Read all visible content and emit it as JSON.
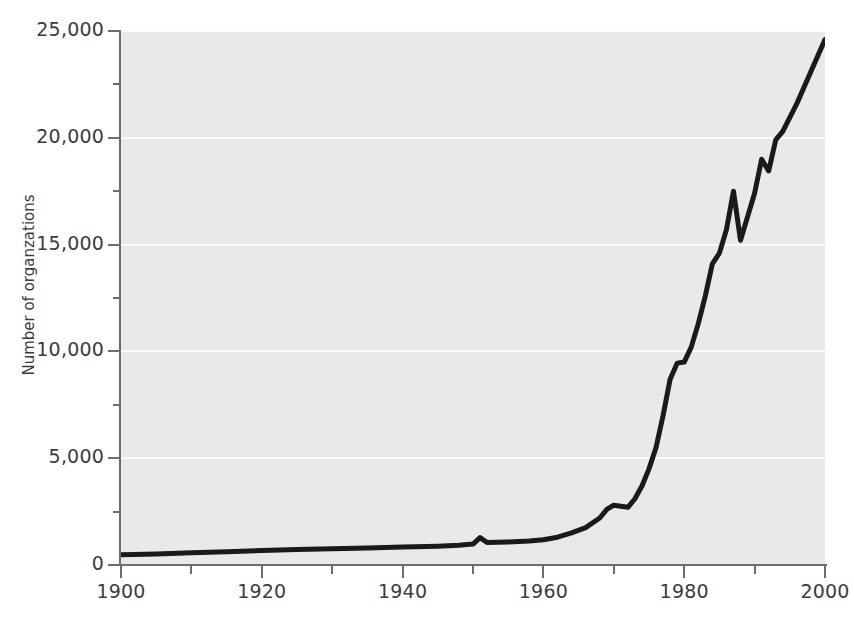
{
  "chart_data": {
    "type": "line",
    "title": "",
    "subtitle": "",
    "xlabel": "",
    "ylabel": "Number of organzations",
    "xlim": [
      1900,
      2000
    ],
    "ylim": [
      0,
      25000
    ],
    "grid": true,
    "legend": null,
    "x_ticks": [
      1900,
      1920,
      1940,
      1960,
      1980,
      2000
    ],
    "x_tick_labels": [
      "1900",
      "1920",
      "1940",
      "1960",
      "1980",
      "2000"
    ],
    "x_minor_ticks": [
      1910,
      1930,
      1950,
      1970,
      1990
    ],
    "y_ticks": [
      0,
      5000,
      10000,
      15000,
      20000,
      25000
    ],
    "y_tick_labels": [
      "0",
      "5,000",
      "10,000",
      "15,000",
      "20,000",
      "25,000"
    ],
    "y_minor_ticks": [
      2500,
      7500,
      12500,
      17500,
      22500
    ],
    "series": [
      {
        "name": "Number of organzations",
        "color": "#1a1a1a",
        "line_width": 5,
        "x": [
          1900,
          1905,
          1910,
          1915,
          1920,
          1925,
          1930,
          1935,
          1940,
          1945,
          1948,
          1950,
          1951,
          1952,
          1955,
          1958,
          1960,
          1962,
          1964,
          1966,
          1968,
          1969,
          1970,
          1971,
          1972,
          1973,
          1974,
          1975,
          1976,
          1977,
          1978,
          1979,
          1980,
          1981,
          1982,
          1983,
          1984,
          1985,
          1986,
          1987,
          1988,
          1989,
          1990,
          1991,
          1992,
          1993,
          1994,
          1996,
          1998,
          2000
        ],
        "y": [
          480,
          520,
          570,
          620,
          680,
          720,
          760,
          800,
          840,
          880,
          920,
          980,
          1280,
          1050,
          1080,
          1120,
          1180,
          1300,
          1500,
          1750,
          2200,
          2600,
          2800,
          2750,
          2700,
          3100,
          3700,
          4500,
          5500,
          7000,
          8700,
          9450,
          9500,
          10200,
          11300,
          12600,
          14100,
          14600,
          15700,
          17500,
          15200,
          16300,
          17400,
          19000,
          18450,
          19900,
          20300,
          21600,
          23100,
          24600
        ]
      }
    ],
    "colors": {
      "plot_background": "#e9e9e9",
      "figure_background": "#ffffff",
      "gridline": "#fbfbfb",
      "axis": "#6d6d6d",
      "tick_text": "#3c3c3c",
      "line": "#1a1a1a"
    }
  }
}
